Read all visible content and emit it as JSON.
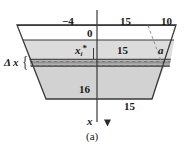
{
  "figure": {
    "caption": "(a)",
    "axis_label": "x",
    "strip_label": "Δ x",
    "labels": {
      "depth_top": "−4",
      "depth_zero": "0",
      "top_width": "15",
      "slant_top": "10",
      "mid_width": "15",
      "distance_a": "a",
      "height_side": "16",
      "bottom_width": "15",
      "sample_point_base": "x",
      "sample_point_sub": "i",
      "sample_point_sup": "*"
    },
    "colors": {
      "fill": "#d0d0d0",
      "fill_upper": "#dadada",
      "outline": "#3a3a3a",
      "strip_fill": "#9a9a9a",
      "strip_edge": "#4a4a4a",
      "text": "#1a1a1a",
      "dashed": "#8c8c8c",
      "background": "#ffffff"
    },
    "geometry": {
      "top_left_x": 17,
      "top_right_x": 176,
      "top_y": 25,
      "bottom_left_x": 46,
      "bottom_right_x": 152,
      "bottom_y": 99,
      "zero_line_y": 40,
      "strip_top_y": 59,
      "strip_bottom_y": 66,
      "axis_x": 97,
      "axis_top_y": 10,
      "axis_bottom_y": 126,
      "dashed_x": 148
    }
  }
}
